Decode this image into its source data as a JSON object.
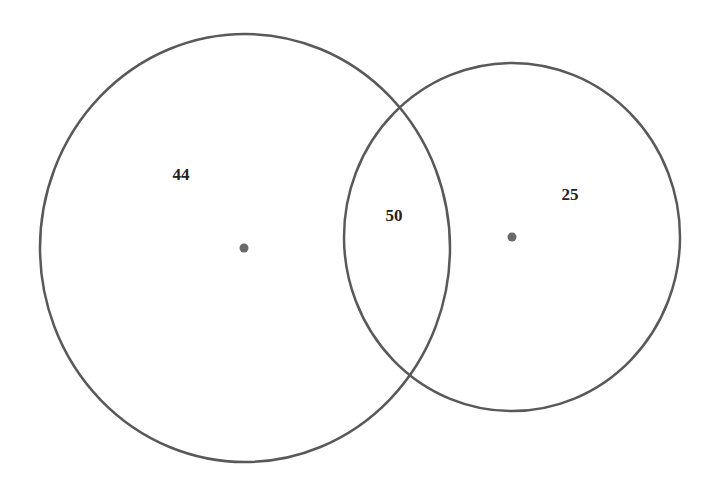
{
  "diagram": {
    "type": "venn",
    "sets": [
      {
        "id": "A",
        "cx": 245,
        "cy": 248,
        "rx": 205,
        "ry": 214,
        "center_dot": {
          "x": 244,
          "y": 248
        }
      },
      {
        "id": "B",
        "cx": 512,
        "cy": 237,
        "rx": 168,
        "ry": 174,
        "center_dot": {
          "x": 512,
          "y": 237
        }
      }
    ],
    "regions": {
      "a_only": {
        "label": "44",
        "x": 181,
        "y": 176
      },
      "intersection": {
        "label": "50",
        "x": 394,
        "y": 222
      },
      "b_only": {
        "label": "25",
        "x": 570,
        "y": 201
      }
    },
    "colors": {
      "stroke": "#595959",
      "dot": "#6a6a6a",
      "text": "#222222",
      "background": "#ffffff"
    }
  }
}
